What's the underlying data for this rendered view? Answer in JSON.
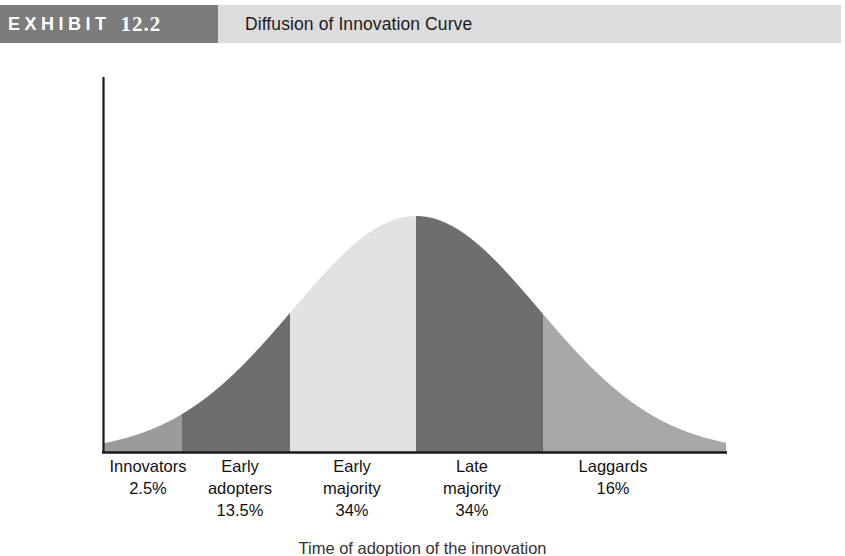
{
  "header": {
    "badge_label": "EXHIBIT",
    "badge_number": "12.2",
    "title": "Diffusion of Innovation Curve",
    "badge_bg": "#7c7c7c",
    "strip_bg": "#dcdcdc"
  },
  "chart_data": {
    "type": "area",
    "title": "Diffusion of Innovation Curve",
    "xlabel": "Time of adoption of the innovation",
    "ylabel": "",
    "grid": false,
    "legend": "none",
    "axis_color": "#1a1a1a",
    "curve_shape": "normal-distribution-bell",
    "categories": [
      "Innovators",
      "Early adopters",
      "Early majority",
      "Late majority",
      "Laggards"
    ],
    "values": [
      2.5,
      13.5,
      34,
      34,
      16
    ],
    "value_labels": [
      "2.5%",
      "13.5%",
      "34%",
      "34%",
      "16%"
    ],
    "segments": [
      {
        "name": "Innovators",
        "pct_label": "2.5%",
        "color": "#9b9b9b",
        "x_start": 103,
        "x_end": 182
      },
      {
        "name": "Early adopters",
        "pct_label": "13.5%",
        "color": "#6e6e6e",
        "x_start": 182,
        "x_end": 290
      },
      {
        "name": "Early majority",
        "pct_label": "34%",
        "color": "#e2e2e2",
        "x_start": 290,
        "x_end": 416
      },
      {
        "name": "Late majority",
        "pct_label": "34%",
        "color": "#6e6e6e",
        "x_start": 416,
        "x_end": 543
      },
      {
        "name": "Laggards",
        "pct_label": "16%",
        "color": "#a8a8a8",
        "x_start": 543,
        "x_end": 726
      }
    ],
    "labels": [
      {
        "line1": "Innovators",
        "line2": "2.5%",
        "line3": "",
        "center_x": 148
      },
      {
        "line1": "Early",
        "line2": "adopters",
        "line3": "13.5%",
        "center_x": 240
      },
      {
        "line1": "Early",
        "line2": "majority",
        "line3": "34%",
        "center_x": 352
      },
      {
        "line1": "Late",
        "line2": "majority",
        "line3": "34%",
        "center_x": 472
      },
      {
        "line1": "Laggards",
        "line2": "16%",
        "line3": "",
        "center_x": 613
      }
    ],
    "caption": "Time of adoption of the innovation"
  }
}
